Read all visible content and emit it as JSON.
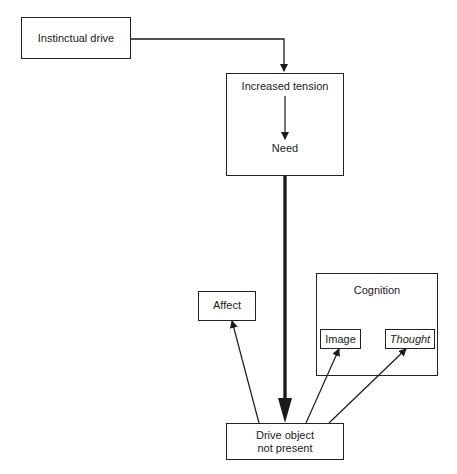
{
  "diagram": {
    "nodes": {
      "instinctual_drive": {
        "label": "Instinctual drive"
      },
      "tension_box": {
        "top_label": "Increased tension",
        "bottom_label": "Need"
      },
      "affect": {
        "label": "Affect"
      },
      "cognition": {
        "label": "Cognition",
        "children": {
          "image": "Image",
          "thought": "Thought"
        }
      },
      "drive_object": {
        "line1": "Drive object",
        "line2": "not present"
      }
    },
    "edges": [
      {
        "from": "Instinctual drive",
        "to": "Increased tension",
        "style": "thin"
      },
      {
        "from": "Increased tension",
        "to": "Need",
        "style": "thin"
      },
      {
        "from": "Need",
        "to": "Drive object not present",
        "style": "thick"
      },
      {
        "from": "Drive object not present",
        "to": "Affect",
        "style": "thin"
      },
      {
        "from": "Drive object not present",
        "to": "Image",
        "style": "thin"
      },
      {
        "from": "Drive object not present",
        "to": "Thought",
        "style": "thin"
      }
    ],
    "colors": {
      "line": "#1a1a1a",
      "background": "#ffffff"
    }
  }
}
